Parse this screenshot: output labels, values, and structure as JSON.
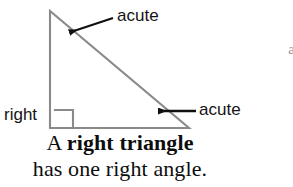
{
  "figure": {
    "type": "geometry-diagram",
    "subject": "right triangle",
    "shape": {
      "name": "right-triangle",
      "stroke_color": "#8a8a8a",
      "vertices": {
        "top": [
          50,
          11
        ],
        "bottom_left": [
          50,
          128
        ],
        "bottom_right": [
          189,
          128
        ]
      },
      "right_angle_marker": {
        "at_vertex": "bottom_left",
        "size": 18
      }
    },
    "annotations": [
      {
        "name": "acute-top",
        "label": "acute",
        "angle_at": "top",
        "arrow": {
          "from": [
            113,
            18
          ],
          "to": [
            67,
            33
          ],
          "color": "#101010"
        }
      },
      {
        "name": "acute-right",
        "label": "acute",
        "angle_at": "bottom_right",
        "arrow": {
          "from": [
            196,
            111
          ],
          "to": [
            156,
            111
          ],
          "color": "#101010"
        }
      },
      {
        "name": "right-angle",
        "label": "right",
        "angle_at": "bottom_left",
        "arrow": null
      }
    ]
  },
  "caption": {
    "line1_prefix": "A ",
    "line1_strong": "right triangle",
    "line2": "has one right angle."
  },
  "edge_fragments": {
    "top": "•",
    "middle": "a"
  },
  "colors": {
    "background": "#ffffff",
    "triangle_stroke": "#8a8a8a",
    "arrow": "#101010",
    "label_text": "#141414",
    "caption_text": "#0d0d0d"
  }
}
